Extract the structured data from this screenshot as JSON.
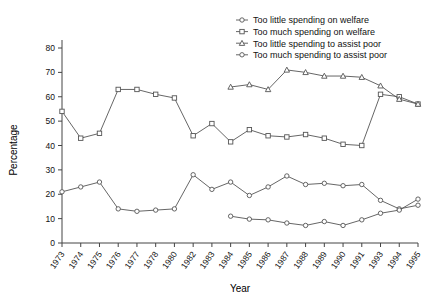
{
  "chart_data": {
    "type": "line",
    "title": "",
    "xlabel": "Year",
    "ylabel": "Percentage",
    "ylim": [
      0,
      80
    ],
    "ytick_step": 10,
    "yticks": [
      "0",
      "10",
      "20",
      "30",
      "40",
      "50",
      "60",
      "70",
      "80"
    ],
    "grid": false,
    "legend_position": "top-right",
    "categories": [
      "1973",
      "1974",
      "1975",
      "1976",
      "1977",
      "1978",
      "1980",
      "1982",
      "1983",
      "1984",
      "1985",
      "1986",
      "1987",
      "1988",
      "1989",
      "1990",
      "1991",
      "1993",
      "1994",
      "1995"
    ],
    "series": [
      {
        "name": "Too little spending on welfare",
        "marker": "circle",
        "values": [
          21,
          23,
          25,
          14,
          13,
          13.5,
          14,
          28,
          22,
          25,
          19.5,
          23,
          27.5,
          24,
          24.5,
          23.5,
          24,
          17.5,
          14,
          15.5
        ]
      },
      {
        "name": "Too much spending on welfare",
        "marker": "square",
        "values": [
          54,
          43,
          45,
          63,
          63,
          61,
          59.5,
          44,
          49,
          41.5,
          46.5,
          44,
          43.5,
          44.5,
          43,
          40.5,
          40,
          61,
          60,
          57
        ]
      },
      {
        "name": "Too little spending to assist poor",
        "marker": "triangle",
        "values": [
          null,
          null,
          null,
          null,
          null,
          null,
          null,
          null,
          null,
          64,
          65,
          63,
          71,
          70,
          68.5,
          68.5,
          68,
          64.5,
          59,
          57
        ]
      },
      {
        "name": "Too much spending to assist poor",
        "marker": "circle-open",
        "values": [
          null,
          null,
          null,
          null,
          null,
          null,
          null,
          null,
          null,
          11,
          9.8,
          9.5,
          8.2,
          7.2,
          8.8,
          7.2,
          9.5,
          12.2,
          13.5,
          18
        ]
      }
    ],
    "legend": [
      "Too little spending on welfare",
      "Too much spending on welfare",
      "Too little spending to assist poor",
      "Too much spending to assist poor"
    ]
  },
  "colors": {
    "line": "#555555",
    "axis": "#444444",
    "background": "#ffffff",
    "text": "#111111"
  }
}
